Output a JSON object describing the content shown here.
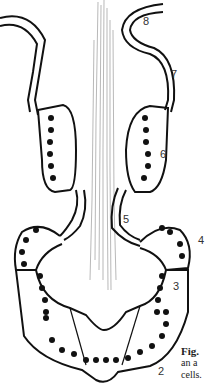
{
  "figure": {
    "type": "anatomical-line-drawing",
    "labels": [
      {
        "id": "8",
        "text": "8",
        "x": 143,
        "y": 16
      },
      {
        "id": "7",
        "text": "7",
        "x": 171,
        "y": 69
      },
      {
        "id": "6",
        "text": "6",
        "x": 160,
        "y": 149
      },
      {
        "id": "5",
        "text": "5",
        "x": 123,
        "y": 214
      },
      {
        "id": "4",
        "text": "4",
        "x": 198,
        "y": 235
      },
      {
        "id": "3",
        "text": "3",
        "x": 173,
        "y": 281
      },
      {
        "id": "2",
        "text": "2",
        "x": 158,
        "y": 366
      }
    ],
    "caption": {
      "line1": "Fig.",
      "line2": "an a",
      "line3": "cells."
    },
    "colors": {
      "ink": "#111111",
      "paper": "#ffffff",
      "fibers": "#777777"
    }
  }
}
